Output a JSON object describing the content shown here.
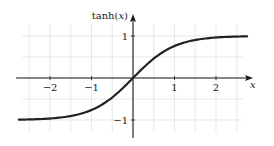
{
  "chart_data": {
    "type": "line",
    "title": "",
    "xlabel": "x",
    "ylabel": "tanh(x)",
    "function": "tanh(x)",
    "xlim": [
      -2.75,
      2.75
    ],
    "ylim": [
      -1.4,
      1.4
    ],
    "grid": true,
    "grid_step": 0.5,
    "x_ticks": [
      -2,
      -1,
      1,
      2
    ],
    "x_tick_labels": [
      "−2",
      "−1",
      "1",
      "2"
    ],
    "y_ticks": [
      1,
      -1
    ],
    "y_tick_labels": [
      "1",
      "−1"
    ],
    "series": [
      {
        "name": "tanh(x)",
        "x": [
          -2.75,
          -2.5,
          -2,
          -1.5,
          -1,
          -0.5,
          0,
          0.5,
          1,
          1.5,
          2,
          2.5,
          2.75
        ],
        "y": [
          -0.992,
          -0.987,
          -0.964,
          -0.905,
          -0.762,
          -0.462,
          0,
          0.462,
          0.762,
          0.905,
          0.964,
          0.987,
          0.992
        ]
      }
    ],
    "legend": null
  },
  "labels": {
    "y_axis": "tanh(x)",
    "y_axis_fn": "tanh(",
    "y_axis_var": "x",
    "y_axis_close": ")",
    "x_axis": "x",
    "xtick_m2": "−2",
    "xtick_m1": "−1",
    "xtick_1": "1",
    "xtick_2": "2",
    "ytick_1": "1",
    "ytick_m1": "−1"
  }
}
